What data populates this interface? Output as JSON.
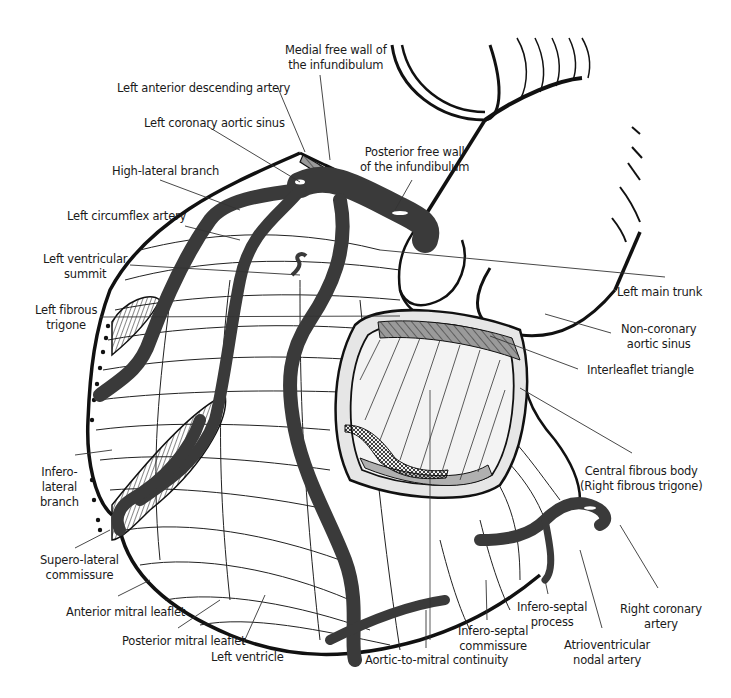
{
  "figure": {
    "colors": {
      "background": "#ffffff",
      "outline": "#111111",
      "artery": "#3a3a3a",
      "fibrous_grey": "#9a9a9a",
      "valve_fill": "#e6e6e6",
      "leader_line": "#333333"
    }
  },
  "labels": {
    "medial_free_wall": [
      "Medial free wall of",
      "the infundibulum"
    ],
    "lad": [
      "Left anterior descending artery"
    ],
    "left_coronary_sinus": [
      "Left coronary aortic sinus"
    ],
    "posterior_free_wall": [
      "Posterior free wall",
      "of the infundibulum"
    ],
    "high_lateral": [
      "High-lateral branch"
    ],
    "circumflex": [
      "Left circumflex artery"
    ],
    "lv_summit": [
      "Left ventricular",
      "summit"
    ],
    "left_fibrous_trigone": [
      "Left fibrous",
      "trigone"
    ],
    "left_main": [
      "Left main trunk"
    ],
    "non_coronary_sinus": [
      "Non-coronary",
      "aortic sinus"
    ],
    "interleaflet": [
      "Interleaflet triangle"
    ],
    "central_fibrous_body": [
      "Central fibrous body",
      "(Right fibrous trigone)"
    ],
    "infero_lateral": [
      "Infero-",
      "lateral",
      "branch"
    ],
    "supero_lateral": [
      "Supero-lateral",
      "commissure"
    ],
    "anterior_mitral": [
      "Anterior mitral leaflet"
    ],
    "posterior_mitral": [
      "Posterior mitral leaflet"
    ],
    "left_ventricle": [
      "Left ventricle"
    ],
    "aortic_mitral": [
      "Aortic-to-mitral continuity"
    ],
    "infero_septal_commissure": [
      "Infero-septal",
      "commissure"
    ],
    "infero_septal_process": [
      "Infero-septal",
      "process"
    ],
    "av_nodal": [
      "Atrioventricular",
      "nodal artery"
    ],
    "rca": [
      "Right coronary",
      "artery"
    ]
  }
}
